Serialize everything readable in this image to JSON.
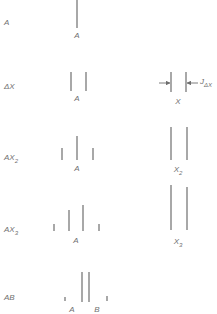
{
  "diagram": {
    "title": "",
    "rows": [
      {
        "id": "A",
        "row_label": "A",
        "row_label_sub": "",
        "label_y": 25,
        "spectrum_A": {
          "lines": [
            {
              "x": 77,
              "y1": 0,
              "y2": 28
            }
          ],
          "labels": [
            {
              "text": "A",
              "x": 77,
              "y": 38
            }
          ]
        },
        "spectrum_X": null
      },
      {
        "id": "AX",
        "row_label": "ΔX",
        "row_label_sub": "",
        "label_y": 89,
        "spectrum_A": {
          "lines": [
            {
              "x": 71,
              "y1": 72,
              "y2": 91
            },
            {
              "x": 86,
              "y1": 72,
              "y2": 91
            }
          ],
          "labels": [
            {
              "text": "A",
              "x": 77,
              "y": 101
            }
          ]
        },
        "spectrum_X": {
          "lines": [
            {
              "x": 171,
              "y1": 72,
              "y2": 92
            },
            {
              "x": 186,
              "y1": 72,
              "y2": 92
            }
          ],
          "labels": [
            {
              "text": "X",
              "x": 178,
              "y": 104
            }
          ],
          "coupling_label": "J",
          "coupling_label_sub": "ΔX",
          "arrow_y": 83
        }
      },
      {
        "id": "AX2",
        "row_label": "AX",
        "row_label_sub": "2",
        "label_y": 160,
        "spectrum_A": {
          "lines": [
            {
              "x": 62,
              "y1": 148,
              "y2": 160
            },
            {
              "x": 77,
              "y1": 136,
              "y2": 160
            },
            {
              "x": 93,
              "y1": 148,
              "y2": 160
            }
          ],
          "labels": [
            {
              "text": "A",
              "x": 77,
              "y": 171
            }
          ]
        },
        "spectrum_X": {
          "lines": [
            {
              "x": 171,
              "y1": 127,
              "y2": 160
            },
            {
              "x": 187,
              "y1": 127,
              "y2": 160
            }
          ],
          "labels": [
            {
              "text": "X",
              "sub": "2",
              "x": 178,
              "y": 172
            }
          ]
        }
      },
      {
        "id": "AX3",
        "row_label": "AX",
        "row_label_sub": "3",
        "label_y": 232,
        "spectrum_A": {
          "lines": [
            {
              "x": 54,
              "y1": 224,
              "y2": 231
            },
            {
              "x": 69,
              "y1": 210,
              "y2": 231
            },
            {
              "x": 83,
              "y1": 205,
              "y2": 231
            },
            {
              "x": 99,
              "y1": 224,
              "y2": 231
            }
          ],
          "labels": [
            {
              "text": "A",
              "x": 76,
              "y": 243
            }
          ]
        },
        "spectrum_X": {
          "lines": [
            {
              "x": 171,
              "y1": 185,
              "y2": 230
            },
            {
              "x": 187,
              "y1": 187,
              "y2": 230
            }
          ],
          "labels": [
            {
              "text": "X",
              "sub": "3",
              "x": 178,
              "y": 244
            }
          ]
        }
      },
      {
        "id": "AB",
        "row_label": "AB",
        "row_label_sub": "",
        "label_y": 300,
        "spectrum_A": {
          "lines": [
            {
              "x": 65,
              "y1": 297,
              "y2": 301
            },
            {
              "x": 82,
              "y1": 272,
              "y2": 302
            },
            {
              "x": 89,
              "y1": 272,
              "y2": 302
            },
            {
              "x": 107,
              "y1": 296,
              "y2": 301
            }
          ],
          "labels": [
            {
              "text": "A",
              "x": 72,
              "y": 312
            },
            {
              "text": "B",
              "x": 97,
              "y": 312
            }
          ]
        },
        "spectrum_X": null
      }
    ]
  }
}
